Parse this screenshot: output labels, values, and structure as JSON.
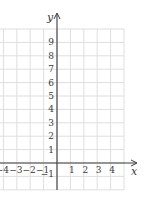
{
  "chart_data": {
    "type": "line",
    "title": "",
    "xlabel": "x",
    "ylabel": "y",
    "xlim": [
      -4.25,
      5
    ],
    "ylim": [
      -2,
      10
    ],
    "grid": true,
    "x_ticks": [
      -4,
      -3,
      -2,
      -1,
      1,
      2,
      3,
      4
    ],
    "x_tick_labels": [
      "−4",
      "−3",
      "−2",
      "−1",
      "1",
      "2",
      "3",
      "4"
    ],
    "y_ticks": [
      -1,
      1,
      2,
      3,
      4,
      5,
      6,
      7,
      8,
      9
    ],
    "y_tick_labels": [
      "−1",
      "1",
      "2",
      "3",
      "4",
      "5",
      "6",
      "7",
      "8",
      "9"
    ],
    "series": []
  },
  "axes": {
    "x_label": "x",
    "y_label": "y"
  },
  "colors": {
    "grid": "#dedede",
    "axis": "#3a3a3a",
    "text": "#3a3a3a"
  }
}
